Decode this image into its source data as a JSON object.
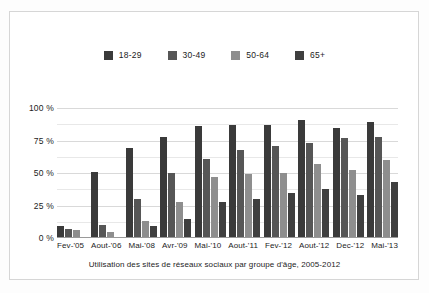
{
  "chart_data": {
    "type": "bar",
    "title": "",
    "caption": "Utilisation des sites de réseaux sociaux par groupe d'âge, 2005-2012",
    "xlabel": "",
    "ylabel": "",
    "ylim": [
      0,
      100
    ],
    "yticks": [
      "0 %",
      "25 %",
      "50 %",
      "75 %",
      "100 %"
    ],
    "ytick_values": [
      0,
      25,
      50,
      75,
      100
    ],
    "grid": true,
    "minor_grid": true,
    "legend_position": "top-center",
    "categories": [
      "Fev-'05",
      "Aout-'06",
      "Mai-'08",
      "Avr-'09",
      "Mai-'10",
      "Aout-'11",
      "Fev-'12",
      "Aout-'12",
      "Dec-'12",
      "Mai-'13"
    ],
    "series": [
      {
        "name": "18-29",
        "color": "#3a3a3a",
        "values": [
          9,
          51,
          69,
          78,
          86,
          87,
          87,
          91,
          85,
          89
        ]
      },
      {
        "name": "30-49",
        "color": "#565656",
        "values": [
          7,
          10,
          30,
          50,
          61,
          68,
          71,
          73,
          77,
          78
        ]
      },
      {
        "name": "50-64",
        "color": "#8e8e8e",
        "values": [
          6,
          5,
          13,
          28,
          47,
          49,
          50,
          57,
          52,
          60
        ]
      },
      {
        "name": "65+",
        "color": "#3f3f3f",
        "values": [
          1,
          1,
          9,
          15,
          28,
          30,
          35,
          38,
          33,
          43
        ]
      }
    ]
  },
  "figure": {
    "border_color": "#d6d6d6",
    "background": "#ffffff"
  }
}
